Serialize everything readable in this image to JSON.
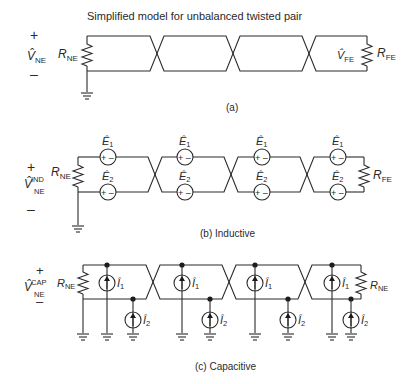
{
  "title": "Simplified model for unbalanced twisted pair",
  "panels": {
    "a": {
      "caption": "(a)",
      "source_voltage": {
        "plus": "+",
        "minus": "–",
        "symbol": "V̂",
        "sub": "NE"
      },
      "near_end_resistor": {
        "symbol": "R",
        "sub": "NE"
      },
      "far_end_voltage": {
        "symbol": "V̂",
        "sub": "FE"
      },
      "far_end_resistor": {
        "symbol": "R",
        "sub": "FE"
      }
    },
    "b": {
      "caption": "(b)  Inductive",
      "source_voltage": {
        "plus": "+",
        "minus": "–",
        "symbol": "V̂",
        "sub": "NE",
        "sup": "IND"
      },
      "near_end_resistor": {
        "symbol": "R",
        "sub": "NE"
      },
      "far_end_resistor": {
        "symbol": "R",
        "sub": "FE"
      },
      "sources": [
        {
          "symbol": "Ê",
          "sub": "1",
          "polarity": "+ –"
        },
        {
          "symbol": "Ê",
          "sub": "2",
          "polarity": "+ –"
        }
      ]
    },
    "c": {
      "caption": "(c)  Capacitive",
      "source_voltage": {
        "plus": "+",
        "minus": "–",
        "symbol": "V̂",
        "sub": "NE",
        "sup": "CAP"
      },
      "near_end_resistor": {
        "symbol": "R",
        "sub": "NE"
      },
      "far_end_resistor": {
        "symbol": "R",
        "sub": "NE"
      },
      "sources": [
        {
          "symbol": "Î",
          "sub": "1"
        },
        {
          "symbol": "Î",
          "sub": "2"
        }
      ]
    }
  }
}
